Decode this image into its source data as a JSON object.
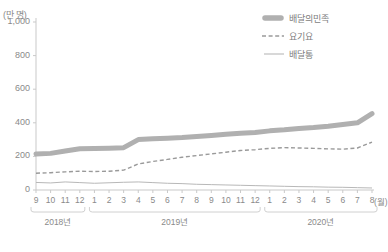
{
  "chart_data": {
    "type": "line",
    "title": "",
    "subtitle": "",
    "xlabel": "(월)",
    "ylabel": "(만 명)",
    "unit_label": "(만 명)",
    "x_unit_label": "(월)",
    "ylim": [
      0,
      1000
    ],
    "yticks": [
      "0",
      "200",
      "400",
      "600",
      "800",
      "1,000"
    ],
    "ytick_values": [
      0,
      200,
      400,
      600,
      800,
      1000
    ],
    "grid": false,
    "legend_position": "top-right",
    "x": [
      "9",
      "10",
      "11",
      "12",
      "1",
      "2",
      "3",
      "4",
      "5",
      "6",
      "7",
      "8",
      "9",
      "10",
      "11",
      "12",
      "1",
      "2",
      "3",
      "4",
      "5",
      "6",
      "7",
      "8"
    ],
    "xtick_labels": [
      "9",
      "10",
      "11",
      "12",
      "1",
      "2",
      "3",
      "4",
      "5",
      "6",
      "7",
      "8",
      "9",
      "10",
      "11",
      "12",
      "1",
      "2",
      "3",
      "4",
      "5",
      "6",
      "7",
      "8"
    ],
    "period_groups": [
      {
        "label": "2018년",
        "start_index": 0,
        "end_index": 3
      },
      {
        "label": "2019년",
        "start_index": 4,
        "end_index": 15
      },
      {
        "label": "2020년",
        "start_index": 16,
        "end_index": 23
      }
    ],
    "series": [
      {
        "name": "배달의민족",
        "style": "thick-solid",
        "color": "#b0b0b0",
        "values": [
          215,
          218,
          232,
          245,
          247,
          249,
          252,
          300,
          305,
          308,
          312,
          318,
          325,
          332,
          338,
          342,
          352,
          358,
          366,
          372,
          380,
          390,
          400,
          455
        ]
      },
      {
        "name": "요기요",
        "style": "dashed",
        "color": "#9a9a9a",
        "values": [
          100,
          103,
          108,
          112,
          110,
          112,
          118,
          155,
          170,
          182,
          195,
          205,
          215,
          225,
          235,
          240,
          248,
          252,
          250,
          248,
          245,
          243,
          250,
          285
        ]
      },
      {
        "name": "배달통",
        "style": "thin-solid",
        "color": "#b8b8b8",
        "values": [
          45,
          42,
          48,
          44,
          40,
          43,
          46,
          48,
          44,
          40,
          38,
          34,
          32,
          30,
          28,
          26,
          24,
          22,
          20,
          19,
          17,
          16,
          14,
          12
        ]
      }
    ]
  },
  "legend": {
    "items": [
      {
        "label": "배달의민족",
        "marker": "thick-bar"
      },
      {
        "label": "요기요",
        "marker": "dashed-line"
      },
      {
        "label": "배달통",
        "marker": "thin-line"
      }
    ]
  }
}
